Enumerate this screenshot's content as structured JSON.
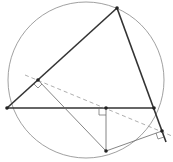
{
  "diagram": {
    "circle": {
      "cx": 86,
      "cy": 80,
      "r": 78,
      "color": "#777777"
    },
    "points": {
      "A": [
        117,
        8
      ],
      "B": [
        7,
        108
      ],
      "C": [
        154,
        108
      ],
      "P": [
        106,
        151
      ],
      "D": [
        38,
        80
      ],
      "E": [
        106,
        108
      ],
      "F": [
        162,
        131
      ]
    },
    "colors": {
      "triangle": "#333333",
      "thin": "#666666",
      "dashed": "#999999",
      "point": "#222222"
    }
  }
}
